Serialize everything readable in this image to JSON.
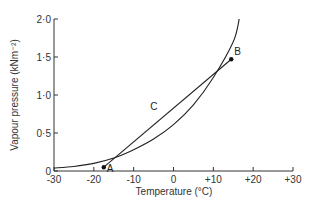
{
  "chart_data": {
    "type": "line",
    "title": "",
    "xlabel": "Temperature (°C)",
    "ylabel": "Vapour pressure (kNm⁻²)",
    "xlim": [
      -30,
      30
    ],
    "ylim": [
      0,
      2.0
    ],
    "xticks": [
      -30,
      -20,
      -10,
      0,
      10,
      20,
      30
    ],
    "xtick_labels": [
      "-30",
      "-20",
      "-10",
      "0",
      "+10",
      "+20",
      "+30"
    ],
    "yticks": [
      0,
      0.5,
      1.0,
      1.5,
      2.0
    ],
    "ytick_labels": [
      "0",
      "0·5",
      "1·0",
      "1·5",
      "2·0"
    ],
    "grid": false,
    "legend": null,
    "series": [
      {
        "name": "Saturation vapour pressure curve",
        "style": "curve",
        "x": [
          -30,
          -25,
          -20,
          -15,
          -10,
          -5,
          0,
          5,
          10,
          15,
          16.5
        ],
        "y": [
          0.04,
          0.06,
          0.1,
          0.17,
          0.28,
          0.42,
          0.61,
          0.87,
          1.23,
          1.7,
          2.0
        ]
      },
      {
        "name": "Mixing line C (A to B)",
        "style": "straight",
        "label": "C",
        "label_at": [
          -4,
          0.8
        ],
        "x": [
          -17.5,
          14.5
        ],
        "y": [
          0.05,
          1.47
        ]
      }
    ],
    "annotations": [
      {
        "label": "A",
        "x": -17.5,
        "y": 0.05
      },
      {
        "label": "B",
        "x": 14.5,
        "y": 1.47
      }
    ]
  }
}
